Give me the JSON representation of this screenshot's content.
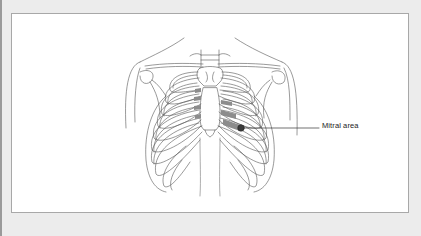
{
  "figure": {
    "type": "anatomical-line-drawing",
    "annotation": {
      "label": "Mitral area",
      "marker_color": "#3a3a3a",
      "leader_color": "#333333"
    },
    "shaded_intercostal_color": "#8c8c8c"
  }
}
